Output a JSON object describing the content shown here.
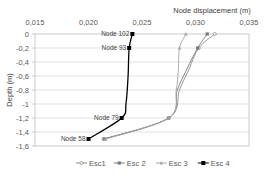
{
  "chart_data": {
    "type": "line",
    "title": "",
    "xlabel": "Node  displacement (m)",
    "ylabel": "Depth  (m)",
    "xlim": [
      0.015,
      0.035
    ],
    "ylim": [
      -1.6,
      0
    ],
    "x_axis_position": "top",
    "x_ticks": [
      "0,015",
      "0,020",
      "0,025",
      "0,030",
      "0,035"
    ],
    "y_ticks": [
      "0",
      "-0,2",
      "-0,4",
      "-0,6",
      "-0,8",
      "-1",
      "-1,2",
      "-1,4",
      "-1,6"
    ],
    "grid": true,
    "legend_position": "bottom",
    "series": [
      {
        "name": "Esc1",
        "color": "#8c8c8c",
        "marker": "open-circle",
        "points": [
          [
            0.0318,
            0
          ],
          [
            0.0303,
            -0.2
          ],
          [
            0.0294,
            -0.5
          ],
          [
            0.0285,
            -0.8
          ],
          [
            0.0275,
            -1.2
          ],
          [
            0.0214,
            -1.5
          ]
        ]
      },
      {
        "name": "Esc 2",
        "color": "#7a7a7a",
        "marker": "square",
        "points": [
          [
            0.0311,
            0
          ],
          [
            0.0302,
            -0.2
          ],
          [
            0.0292,
            -0.5
          ],
          [
            0.0283,
            -0.8
          ],
          [
            0.0275,
            -1.2
          ],
          [
            0.0215,
            -1.5
          ]
        ]
      },
      {
        "name": "Esc 3",
        "color": "#a6a6a6",
        "marker": "triangle",
        "points": [
          [
            0.0291,
            0
          ],
          [
            0.0285,
            -0.2
          ],
          [
            0.0284,
            -0.5
          ],
          [
            0.0282,
            -0.8
          ],
          [
            0.0275,
            -1.2
          ],
          [
            0.0216,
            -1.5
          ]
        ]
      },
      {
        "name": "Esc 4",
        "color": "#000000",
        "marker": "filled-square",
        "points": [
          [
            0.0241,
            0
          ],
          [
            0.0238,
            -0.2
          ],
          [
            0.0237,
            -0.6
          ],
          [
            0.0235,
            -1.0
          ],
          [
            0.0231,
            -1.2
          ],
          [
            0.02,
            -1.5
          ]
        ]
      }
    ],
    "annotations": [
      {
        "text": "Node 102",
        "x": 0.0241,
        "y": 0
      },
      {
        "text": "Node 93",
        "x": 0.0238,
        "y": -0.2
      },
      {
        "text": "Node 79",
        "x": 0.0231,
        "y": -1.2
      },
      {
        "text": "Node 58",
        "x": 0.02,
        "y": -1.5
      }
    ]
  }
}
